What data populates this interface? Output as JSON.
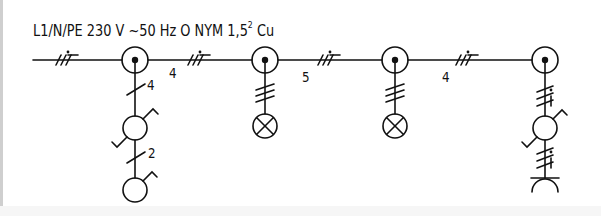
{
  "diagram": {
    "title_main": "L1/N/PE 230 V ~50 Hz O NYM 1,5",
    "title_sup": "2",
    "title_tail": " Cu",
    "colors": {
      "line": "#111111",
      "background": "#ffffff"
    },
    "main_line": {
      "segments": [
        {
          "conductor_count_label": "",
          "marker": "3-conductor with PE"
        },
        {
          "conductor_count_label": "4",
          "marker": "3-conductor with PE"
        },
        {
          "conductor_count_label": "5",
          "marker": "3-conductor with PE"
        },
        {
          "conductor_count_label": "4",
          "marker": "3-conductor with PE"
        }
      ],
      "junction_boxes": 4
    },
    "branches": [
      {
        "junction": 1,
        "devices": [
          "switch",
          "switch"
        ],
        "wire_labels": [
          "4",
          "2"
        ]
      },
      {
        "junction": 2,
        "devices": [
          "lamp"
        ],
        "wire_labels": []
      },
      {
        "junction": 3,
        "devices": [
          "lamp"
        ],
        "wire_labels": []
      },
      {
        "junction": 4,
        "devices": [
          "switch",
          "socket-outlet"
        ],
        "wire_labels": []
      }
    ],
    "labels": {
      "seg2": "4",
      "seg3": "5",
      "seg4": "4",
      "branch1_upper": "4",
      "branch1_lower": "2"
    }
  }
}
